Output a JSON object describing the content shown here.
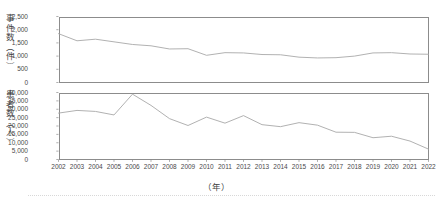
{
  "figure": {
    "xaxis_label": "（年）",
    "panels": [
      {
        "id": "events",
        "axis_label": "事件数（件）",
        "unit": "件",
        "yticks": [
          "0",
          "500",
          "1,000",
          "1,500",
          "2,000",
          "2,500"
        ]
      },
      {
        "id": "patients",
        "axis_label": "患者数（人）",
        "unit": "人",
        "yticks": [
          "0",
          "5,000",
          "10,000",
          "15,000",
          "20,000",
          "25,000",
          "30,000",
          "35,000",
          "40,000"
        ]
      }
    ],
    "xticks": [
      "2002",
      "2003",
      "2004",
      "2005",
      "2006",
      "2007",
      "2008",
      "2009",
      "2010",
      "2011",
      "2012",
      "2013",
      "2014",
      "2015",
      "2016",
      "2017",
      "2018",
      "2019",
      "2020",
      "2021",
      "2022"
    ],
    "line_color": "#a8a8a8",
    "frame_color": "#8c8c8c"
  },
  "chart_data": [
    {
      "type": "line",
      "title": "",
      "xlabel": "（年）",
      "ylabel": "事件数（件）",
      "x": [
        2002,
        2003,
        2004,
        2005,
        2006,
        2007,
        2008,
        2009,
        2010,
        2011,
        2012,
        2013,
        2014,
        2015,
        2016,
        2017,
        2018,
        2019,
        2020,
        2021,
        2022
      ],
      "values": [
        1850,
        1580,
        1640,
        1540,
        1440,
        1390,
        1270,
        1280,
        1030,
        1130,
        1120,
        1060,
        1050,
        960,
        930,
        940,
        1000,
        1120,
        1130,
        1080,
        1070,
        960,
        1290,
        1130,
        950,
        690,
        880
      ],
      "series": [
        {
          "name": "事件数",
          "values": [
            1850,
            1580,
            1640,
            1540,
            1440,
            1390,
            1270,
            1280,
            1030,
            1130,
            1120,
            1060,
            1050,
            960,
            930,
            940,
            1000,
            1120,
            1130,
            1080,
            1070
          ]
        }
      ],
      "ylim": [
        0,
        2500
      ],
      "ytick_step": 500,
      "grid": false,
      "legend": "none"
    },
    {
      "type": "line",
      "title": "",
      "xlabel": "（年）",
      "ylabel": "患者数（人）",
      "x": [
        2002,
        2003,
        2004,
        2005,
        2006,
        2007,
        2008,
        2009,
        2010,
        2011,
        2012,
        2013,
        2014,
        2015,
        2016,
        2017,
        2018,
        2019,
        2020,
        2021,
        2022
      ],
      "series": [
        {
          "name": "患者数",
          "values": [
            27700,
            29300,
            28700,
            26600,
            39000,
            32300,
            24400,
            20300,
            25300,
            21700,
            26200,
            20800,
            19600,
            22000,
            20500,
            16300,
            16200,
            13000,
            13900,
            11000,
            6200
          ]
        }
      ],
      "ylim": [
        0,
        40000
      ],
      "ytick_step": 5000,
      "grid": false,
      "legend": "none"
    }
  ]
}
